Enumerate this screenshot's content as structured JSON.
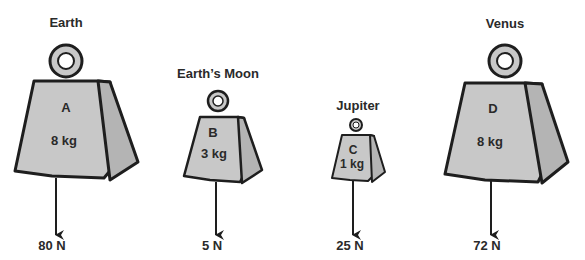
{
  "weights": [
    {
      "planet": "Earth",
      "letter": "A",
      "mass": "8 kg",
      "force": "80 N"
    },
    {
      "planet": "Earth’s Moon",
      "letter": "B",
      "mass": "3 kg",
      "force": "5 N"
    },
    {
      "planet": "Jupiter",
      "letter": "C",
      "mass": "1 kg",
      "force": "25 N"
    },
    {
      "planet": "Venus",
      "letter": "D",
      "mass": "8 kg",
      "force": "72 N"
    }
  ],
  "colors": {
    "weight_fill": "#c8c8c8",
    "weight_side": "#b4b4b4",
    "outline": "#1e1e1e",
    "text": "#2a2a2a"
  }
}
